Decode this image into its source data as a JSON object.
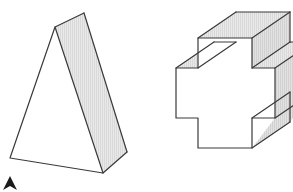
{
  "canvas": {
    "width": 293,
    "height": 192,
    "background_color": "#ffffff"
  },
  "style": {
    "outline_color": "#3a3a3a",
    "outline_width": 1.2,
    "face_light": "#ffffff",
    "face_shaded": "#e6e6e6",
    "face_shaded_mid": "#dcdcdc",
    "hatch_color": "#c9c9c9",
    "cursor_color": "#1a1a1a"
  },
  "figures": [
    {
      "id": "figure-left",
      "name": "triangular-prism",
      "label": "Triangular prism",
      "description": "A tall triangular prism drawn in oblique projection; the left front triangular face is white and the right lateral rectangular face is shaded with fine vertical hatching.",
      "faces": [
        {
          "name": "front-triangle-face",
          "fill": "#ffffff",
          "points": "55,27 10,158 103,173"
        },
        {
          "name": "right-lateral-face",
          "fill": "#e6e6e6",
          "hatched": true,
          "points": "55,27 84,13 127,152 103,173"
        }
      ],
      "edges": [
        {
          "name": "front-left-edge",
          "points": "55,27 10,158"
        },
        {
          "name": "front-bottom-edge",
          "points": "10,158 103,173"
        },
        {
          "name": "front-right-edge",
          "points": "55,27 103,173"
        },
        {
          "name": "top-ridge-edge",
          "points": "55,27 84,13"
        },
        {
          "name": "back-right-edge",
          "points": "84,13 127,152"
        },
        {
          "name": "bottom-right-edge",
          "points": "127,152 103,173"
        }
      ]
    },
    {
      "id": "figure-right",
      "name": "cross-shaped-prism",
      "label": "Cross-shaped prism",
      "description": "A plus/cross shaped solid extruded back and to the upper right; the cross front face is white, the top and right side faces are shaded with fine hatching.",
      "faces": [
        {
          "name": "cross-front-face",
          "fill": "#ffffff",
          "points": "176,68 198,68 198,38 252,38 252,68 275,68 275,118 252,118 252,148 198,148 198,118 176,118"
        },
        {
          "name": "top-face-upper-arm",
          "fill": "#e6e6e6",
          "hatched": true,
          "points": "198,38 252,38 290,12 236,12"
        },
        {
          "name": "top-face-left-shoulder",
          "fill": "#e6e6e6",
          "hatched": true,
          "points": "176,68 198,68 236,42 214,42"
        },
        {
          "name": "top-face-right-shoulder",
          "fill": "#dcdcdc",
          "hatched": true,
          "points": "252,68 275,68 313,42 290,42"
        },
        {
          "name": "right-side-face-upper",
          "fill": "#dcdcdc",
          "hatched": true,
          "points": "252,38 290,12 290,42 252,68"
        },
        {
          "name": "right-side-face-lower",
          "fill": "#dcdcdc",
          "hatched": true,
          "points": "275,68 313,42 313,92 275,118"
        },
        {
          "name": "bottom-right-arm-face",
          "fill": "#dcdcdc",
          "hatched": true,
          "points": "252,148 275,118 313,92 290,122"
        }
      ],
      "edges": [
        {
          "name": "cross-outline",
          "points": "176,68 198,68 198,38 252,38 252,68 275,68 275,118 252,118 252,148 198,148 198,118 176,118 176,68"
        },
        {
          "name": "depth-edge-left-shoulder",
          "points": "176,68 214,42"
        },
        {
          "name": "depth-edge-notch-left",
          "points": "198,68 236,42"
        },
        {
          "name": "depth-edge-top-left",
          "points": "198,38 236,12"
        },
        {
          "name": "depth-edge-top-right",
          "points": "252,38 290,12"
        },
        {
          "name": "depth-edge-right-notch",
          "points": "252,68 290,42"
        },
        {
          "name": "depth-edge-right-arm",
          "points": "275,68 313,42"
        },
        {
          "name": "depth-edge-right-lower",
          "points": "275,118 313,92"
        },
        {
          "name": "depth-edge-bottom-notch",
          "points": "252,118 290,92"
        },
        {
          "name": "depth-edge-bottom-arm",
          "points": "252,148 290,122"
        },
        {
          "name": "back-top-edge",
          "points": "236,12 290,12"
        },
        {
          "name": "back-shoulder-edge",
          "points": "214,42 236,42"
        },
        {
          "name": "back-right-shoulder-edge",
          "points": "290,42 313,42"
        },
        {
          "name": "back-right-vertical-upper",
          "points": "290,12 290,42"
        },
        {
          "name": "back-right-vertical-lower",
          "points": "313,42 313,92"
        },
        {
          "name": "back-bottom-notch-edge",
          "points": "290,92 290,122"
        }
      ]
    }
  ],
  "cursor": {
    "name": "mouse-cursor",
    "label": "pointer",
    "x": 4,
    "y": 176,
    "color": "#1a1a1a"
  }
}
